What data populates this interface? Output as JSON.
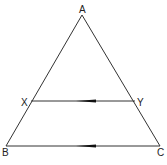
{
  "diagram": {
    "colors": {
      "line": "#333333",
      "arrow": "#111111",
      "label": "#222222",
      "background": "#ffffff"
    },
    "points": {
      "A": {
        "label": "A",
        "x": 82,
        "y": 15
      },
      "B": {
        "label": "B",
        "x": 6,
        "y": 146
      },
      "C": {
        "label": "C",
        "x": 160,
        "y": 146
      },
      "X": {
        "label": "X",
        "x": 31,
        "y": 101
      },
      "Y": {
        "label": "Y",
        "x": 135,
        "y": 101
      }
    },
    "segments": [
      {
        "from": "A",
        "to": "B"
      },
      {
        "from": "A",
        "to": "C"
      },
      {
        "from": "B",
        "to": "C",
        "parallel_mark": "arrow-left"
      },
      {
        "from": "X",
        "to": "Y",
        "parallel_mark": "arrow-left"
      }
    ],
    "labels": {
      "A": "A",
      "B": "B",
      "C": "C",
      "X": "X",
      "Y": "Y"
    }
  }
}
